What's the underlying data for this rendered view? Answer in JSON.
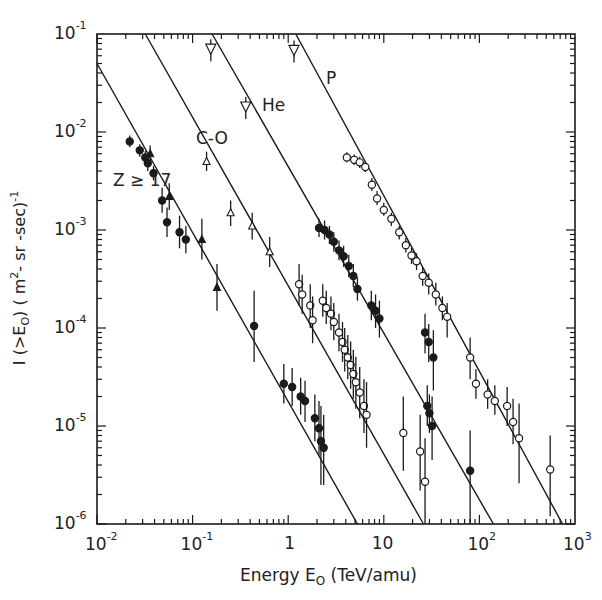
{
  "chart_data": {
    "type": "scatter",
    "title": "",
    "xlabel": "Energy E0 (TeV/amu)",
    "ylabel": "I (>E0) (m^2-sr-sec)^-1",
    "x_scale": "log",
    "y_scale": "log",
    "xlim": [
      0.01,
      1000
    ],
    "ylim": [
      1e-06,
      0.1
    ],
    "grid": false,
    "legend_position": "inline-labels",
    "x_ticks": [
      "10^-2",
      "10^-1",
      "1",
      "10",
      "10^2",
      "10^3"
    ],
    "y_ticks": [
      "10^-1",
      "10^-2",
      "10^-3",
      "10^-4",
      "10^-5",
      "10^-6"
    ],
    "series": [
      {
        "name": "P",
        "label_pos": {
          "x": 326,
          "y": 78
        },
        "marker": "open-circle",
        "fit_line": {
          "x": [
            1.2,
            740
          ],
          "y": [
            0.1,
            1e-06
          ]
        },
        "upper_limits": [
          {
            "x": 1.15,
            "y": 0.068
          }
        ],
        "points": [
          {
            "x": 4.1,
            "y": 0.0055,
            "err": [
              0.0049,
              0.0062
            ]
          },
          {
            "x": 4.9,
            "y": 0.0052,
            "err": [
              0.0046,
              0.0059
            ]
          },
          {
            "x": 5.6,
            "y": 0.0049,
            "err": [
              0.0043,
              0.0056
            ]
          },
          {
            "x": 6.4,
            "y": 0.0044,
            "err": [
              0.0039,
              0.005
            ]
          },
          {
            "x": 7.5,
            "y": 0.0029,
            "err": [
              0.0025,
              0.0034
            ]
          },
          {
            "x": 8.5,
            "y": 0.0021,
            "err": [
              0.0018,
              0.0025
            ]
          },
          {
            "x": 10.0,
            "y": 0.0016,
            "err": [
              0.0014,
              0.0019
            ]
          },
          {
            "x": 12.0,
            "y": 0.0013,
            "err": [
              0.0011,
              0.0015
            ]
          },
          {
            "x": 14.5,
            "y": 0.00095,
            "err": [
              0.0008,
              0.0011
            ]
          },
          {
            "x": 17.0,
            "y": 0.0007,
            "err": [
              0.00059,
              0.00083
            ]
          },
          {
            "x": 19.5,
            "y": 0.00055,
            "err": [
              0.00045,
              0.00066
            ]
          },
          {
            "x": 22.0,
            "y": 0.00048,
            "err": [
              0.00039,
              0.00058
            ]
          },
          {
            "x": 25.5,
            "y": 0.00034,
            "err": [
              0.00027,
              0.00042
            ]
          },
          {
            "x": 29.5,
            "y": 0.00029,
            "err": [
              0.00022,
              0.00036
            ]
          },
          {
            "x": 35.0,
            "y": 0.00022,
            "err": [
              0.00017,
              0.00029
            ]
          },
          {
            "x": 41.0,
            "y": 0.00016,
            "err": [
              0.00012,
              0.00021
            ]
          },
          {
            "x": 46.0,
            "y": 0.00013,
            "err": [
              8e-05,
              0.00018
            ]
          },
          {
            "x": 80.0,
            "y": 5e-05,
            "err": [
              3e-05,
              8e-05
            ]
          },
          {
            "x": 92.0,
            "y": 2.7e-05,
            "err": [
              1.9e-05,
              3.8e-05
            ]
          },
          {
            "x": 122.0,
            "y": 2.1e-05,
            "err": [
              1.5e-05,
              3e-05
            ]
          },
          {
            "x": 145.0,
            "y": 1.8e-05,
            "err": [
              1.3e-05,
              2.6e-05
            ]
          },
          {
            "x": 195.0,
            "y": 1.6e-05,
            "err": [
              1e-05,
              2.5e-05
            ]
          },
          {
            "x": 225.0,
            "y": 1.1e-05,
            "err": [
              6.5e-06,
              1.9e-05
            ]
          },
          {
            "x": 260.0,
            "y": 7.5e-06,
            "err": [
              2.6e-06,
              1.7e-05
            ]
          },
          {
            "x": 550.0,
            "y": 3.6e-06,
            "err": [
              1.2e-06,
              8e-06
            ]
          }
        ]
      },
      {
        "name": "He",
        "label_pos": {
          "x": 262,
          "y": 105
        },
        "marker": "filled-circle",
        "fit_line": {
          "x": [
            0.16,
            140
          ],
          "y": [
            0.1,
            1e-06
          ]
        },
        "upper_limits": [
          {
            "x": 0.36,
            "y": 0.018
          }
        ],
        "points": [
          {
            "x": 2.1,
            "y": 0.00105,
            "err": [
              0.00085,
              0.0013
            ]
          },
          {
            "x": 2.4,
            "y": 0.001,
            "err": [
              0.0008,
              0.00125
            ]
          },
          {
            "x": 2.7,
            "y": 0.0009,
            "err": [
              0.00072,
              0.0011
            ]
          },
          {
            "x": 3.0,
            "y": 0.00076,
            "err": [
              0.0006,
              0.00095
            ]
          },
          {
            "x": 3.4,
            "y": 0.00062,
            "err": [
              0.00049,
              0.00078
            ]
          },
          {
            "x": 3.8,
            "y": 0.00054,
            "err": [
              0.00042,
              0.00069
            ]
          },
          {
            "x": 4.3,
            "y": 0.00043,
            "err": [
              0.00033,
              0.00056
            ]
          },
          {
            "x": 4.8,
            "y": 0.00034,
            "err": [
              0.00026,
              0.00045
            ]
          },
          {
            "x": 5.3,
            "y": 0.00025,
            "err": [
              0.00019,
              0.00033
            ]
          },
          {
            "x": 7.4,
            "y": 0.00017,
            "err": [
              0.00012,
              0.00024
            ]
          },
          {
            "x": 8.2,
            "y": 0.00015,
            "err": [
              0.0001,
              0.00022
            ]
          },
          {
            "x": 9.0,
            "y": 0.000125,
            "err": [
              8e-05,
              0.00019
            ]
          },
          {
            "x": 27.0,
            "y": 9e-05,
            "err": [
              5.5e-05,
              0.00014
            ]
          },
          {
            "x": 29.5,
            "y": 7.2e-05,
            "err": [
              4.5e-05,
              0.00011
            ]
          },
          {
            "x": 33.0,
            "y": 5e-05,
            "err": [
              2.3e-05,
              9.5e-05
            ]
          },
          {
            "x": 28.5,
            "y": 1.6e-05,
            "err": [
              1e-05,
              2.6e-05
            ]
          },
          {
            "x": 30.0,
            "y": 1.35e-05,
            "err": [
              8.5e-06,
              2.1e-05
            ]
          },
          {
            "x": 32.0,
            "y": 1e-05,
            "err": [
              4.5e-06,
              2e-05
            ]
          },
          {
            "x": 80.0,
            "y": 3.5e-06,
            "err": [
              1e-06,
              9e-06
            ]
          }
        ]
      },
      {
        "name": "C-O",
        "label_pos": {
          "x": 196,
          "y": 138
        },
        "marker": "open-circle / open-triangle",
        "fit_line": {
          "x": [
            0.032,
            26
          ],
          "y": [
            0.1,
            1e-06
          ]
        },
        "upper_limits": [
          {
            "x": 0.155,
            "y": 0.07
          }
        ],
        "points": [
          {
            "x": 0.14,
            "y": 0.005,
            "err": [
              0.004,
              0.0063
            ],
            "marker": "open-triangle"
          },
          {
            "x": 0.25,
            "y": 0.0015,
            "err": [
              0.0011,
              0.002
            ],
            "marker": "open-triangle"
          },
          {
            "x": 0.42,
            "y": 0.0011,
            "err": [
              0.0008,
              0.0015
            ],
            "marker": "open-triangle"
          },
          {
            "x": 0.64,
            "y": 0.0006,
            "err": [
              0.00042,
              0.00085
            ],
            "marker": "open-triangle"
          },
          {
            "x": 1.3,
            "y": 0.00028,
            "err": [
              0.00017,
              0.00045
            ]
          },
          {
            "x": 1.4,
            "y": 0.00022,
            "err": [
              0.00014,
              0.00035
            ]
          },
          {
            "x": 1.7,
            "y": 0.00017,
            "err": [
              0.0001,
              0.00028
            ]
          },
          {
            "x": 1.8,
            "y": 0.00012,
            "err": [
              7e-05,
              0.00021
            ]
          },
          {
            "x": 2.3,
            "y": 0.00019,
            "err": [
              0.00013,
              0.00028
            ]
          },
          {
            "x": 2.5,
            "y": 0.00016,
            "err": [
              0.00011,
              0.00024
            ]
          },
          {
            "x": 2.8,
            "y": 0.00014,
            "err": [
              9.5e-05,
              0.00021
            ]
          },
          {
            "x": 3.0,
            "y": 0.000115,
            "err": [
              7.5e-05,
              0.00018
            ]
          },
          {
            "x": 3.4,
            "y": 9e-05,
            "err": [
              5.8e-05,
              0.00014
            ]
          },
          {
            "x": 3.7,
            "y": 7.2e-05,
            "err": [
              4.5e-05,
              0.000115
            ]
          },
          {
            "x": 3.9,
            "y": 6e-05,
            "err": [
              3.6e-05,
              0.0001
            ]
          },
          {
            "x": 4.2,
            "y": 5e-05,
            "err": [
              3e-05,
              8.5e-05
            ]
          },
          {
            "x": 4.5,
            "y": 4.2e-05,
            "err": [
              2.4e-05,
              7.3e-05
            ]
          },
          {
            "x": 4.8,
            "y": 3.4e-05,
            "err": [
              1.9e-05,
              6e-05
            ]
          },
          {
            "x": 5.1,
            "y": 2.8e-05,
            "err": [
              1.5e-05,
              5.1e-05
            ]
          },
          {
            "x": 5.6,
            "y": 2.2e-05,
            "err": [
              1.2e-05,
              4e-05
            ]
          },
          {
            "x": 6.2,
            "y": 1.6e-05,
            "err": [
              8.5e-06,
              3e-05
            ]
          },
          {
            "x": 6.6,
            "y": 1.3e-05,
            "err": [
              6e-06,
              2.8e-05
            ]
          },
          {
            "x": 16.0,
            "y": 8.5e-06,
            "err": [
              3.5e-06,
              2e-05
            ]
          },
          {
            "x": 24.0,
            "y": 5.5e-06,
            "err": [
              2.2e-06,
              1.3e-05
            ]
          },
          {
            "x": 27.0,
            "y": 2.7e-06,
            "err": [
              1e-06,
              7.5e-06
            ]
          }
        ]
      },
      {
        "name": "Z ≥ 17",
        "label_pos": {
          "x": 113,
          "y": 180
        },
        "marker": "filled-circle / filled-triangle",
        "fit_line": {
          "x": [
            0.01,
            5.3
          ],
          "y": [
            0.05,
            1e-06
          ]
        },
        "points": [
          {
            "x": 0.022,
            "y": 0.008,
            "err": [
              0.007,
              0.0092
            ]
          },
          {
            "x": 0.028,
            "y": 0.0065,
            "err": [
              0.0056,
              0.0075
            ]
          },
          {
            "x": 0.032,
            "y": 0.0055,
            "err": [
              0.0047,
              0.0064
            ]
          },
          {
            "x": 0.036,
            "y": 0.006,
            "err": [
              0.005,
              0.0073
            ],
            "marker": "filled-triangle"
          },
          {
            "x": 0.034,
            "y": 0.0048,
            "err": [
              0.004,
              0.0058
            ]
          },
          {
            "x": 0.039,
            "y": 0.0038,
            "err": [
              0.0032,
              0.0045
            ]
          },
          {
            "x": 0.048,
            "y": 0.002,
            "err": [
              0.0015,
              0.0027
            ]
          },
          {
            "x": 0.057,
            "y": 0.0022,
            "err": [
              0.0016,
              0.003
            ],
            "marker": "filled-triangle"
          },
          {
            "x": 0.054,
            "y": 0.0012,
            "err": [
              0.00085,
              0.0017
            ]
          },
          {
            "x": 0.073,
            "y": 0.00095,
            "err": [
              0.00065,
              0.0014
            ]
          },
          {
            "x": 0.085,
            "y": 0.0008,
            "err": [
              0.00058,
              0.0011
            ]
          },
          {
            "x": 0.125,
            "y": 0.0008,
            "err": [
              0.0005,
              0.0013
            ],
            "marker": "filled-triangle"
          },
          {
            "x": 0.18,
            "y": 0.00026,
            "err": [
              0.00015,
              0.00045
            ],
            "marker": "filled-triangle"
          },
          {
            "x": 0.44,
            "y": 0.000105,
            "err": [
              4.5e-05,
              0.00024
            ]
          },
          {
            "x": 0.9,
            "y": 2.7e-05,
            "err": [
              1.7e-05,
              4.3e-05
            ]
          },
          {
            "x": 1.1,
            "y": 2.5e-05,
            "err": [
              1.6e-05,
              3.9e-05
            ]
          },
          {
            "x": 1.35,
            "y": 2e-05,
            "err": [
              1.3e-05,
              3.1e-05
            ]
          },
          {
            "x": 1.5,
            "y": 1.8e-05,
            "err": [
              1.1e-05,
              2.9e-05
            ]
          },
          {
            "x": 1.9,
            "y": 1.2e-05,
            "err": [
              7e-06,
              2.1e-05
            ]
          },
          {
            "x": 2.1,
            "y": 9.5e-06,
            "err": [
              5e-06,
              1.8e-05
            ]
          },
          {
            "x": 2.2,
            "y": 7e-06,
            "err": [
              2.5e-06,
              1.6e-05
            ]
          },
          {
            "x": 2.35,
            "y": 6e-06,
            "err": [
              2.5e-06,
              1.3e-05
            ]
          }
        ]
      }
    ]
  },
  "axes": {
    "x_tick_labels": [
      {
        "base": "10",
        "exp": "-2"
      },
      {
        "base": "10",
        "exp": "-1"
      },
      {
        "base": "1",
        "exp": ""
      },
      {
        "base": "10",
        "exp": ""
      },
      {
        "base": "10",
        "exp": "2"
      },
      {
        "base": "10",
        "exp": "3"
      }
    ],
    "y_tick_labels": [
      {
        "base": "10",
        "exp": "-1"
      },
      {
        "base": "10",
        "exp": "-2"
      },
      {
        "base": "10",
        "exp": "-3"
      },
      {
        "base": "10",
        "exp": "-4"
      },
      {
        "base": "10",
        "exp": "-5"
      },
      {
        "base": "10",
        "exp": "-6"
      }
    ],
    "xlabel_parts": {
      "pre": "Energy  E",
      "sub": "O",
      "post": "  (TeV/amu)"
    },
    "ylabel_parts": {
      "pre": "I (>E",
      "sub": "O",
      "mid": ")  ( m",
      "sup": "2",
      "post": "- sr -sec)",
      "sup2": "-1"
    }
  },
  "colors": {
    "ink": "#1a1a1a",
    "background": "#ffffff"
  }
}
